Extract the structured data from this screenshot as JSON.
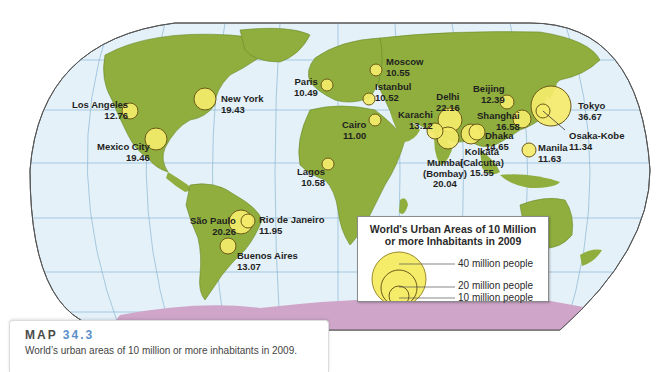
{
  "colors": {
    "ocean": "#e4f1f8",
    "land": "#8fae3e",
    "land_border": "#6a8a2a",
    "graticule": "#8bb6d4",
    "frame": "#555555",
    "antarctica": "#cfa6c9",
    "circle_fill": "#f5ec6a",
    "circle_stroke": "#6b5a1a",
    "caption_number": "#5b8fc9"
  },
  "cities": [
    {
      "name": "Los Angeles",
      "population": "12.76"
    },
    {
      "name": "New York",
      "population": "19.43"
    },
    {
      "name": "Mexico City",
      "population": "19.46"
    },
    {
      "name": "Paris",
      "population": "10.49"
    },
    {
      "name": "Moscow",
      "population": "10.55"
    },
    {
      "name": "Istanbul",
      "population": "10.52"
    },
    {
      "name": "Cairo",
      "population": "11.00"
    },
    {
      "name": "Lagos",
      "population": "10.58"
    },
    {
      "name": "Karachi",
      "population": "13.12"
    },
    {
      "name": "Delhi",
      "population": "22.16"
    },
    {
      "name": "Mumbai",
      "name2": "(Bombay)",
      "population": "20.04"
    },
    {
      "name": "Kolkata",
      "name2": "(Calcutta)",
      "population": "15.55"
    },
    {
      "name": "Dhaka",
      "population": "14.65"
    },
    {
      "name": "Beijing",
      "population": "12.39"
    },
    {
      "name": "Shanghai",
      "population": "16.58"
    },
    {
      "name": "Tokyo",
      "population": "36.67"
    },
    {
      "name": "Osaka-Kobe",
      "population": "11.34"
    },
    {
      "name": "Manila",
      "population": "11.63"
    },
    {
      "name": "São Paulo",
      "population": "20.26"
    },
    {
      "name": "Rio de Janeiro",
      "population": "11.95"
    },
    {
      "name": "Buenos Aires",
      "population": "13.07"
    }
  ],
  "legend": {
    "title_line1": "World's Urban Areas of 10 Million",
    "title_line2": "or more Inhabitants in 2009",
    "items": [
      {
        "label": "40 million people",
        "value": 40
      },
      {
        "label": "20 million people",
        "value": 20
      },
      {
        "label": "10 million people",
        "value": 10
      }
    ]
  },
  "caption": {
    "map_word": "MAP",
    "map_number": "34.3",
    "description": "World’s urban areas of 10 million or more inhabitants in 2009."
  }
}
